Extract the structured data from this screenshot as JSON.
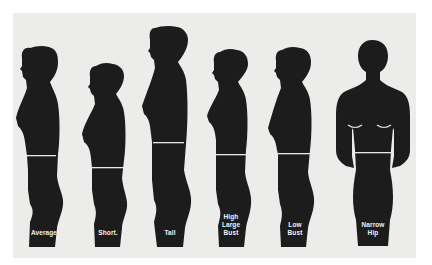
{
  "diagram": {
    "background": "#ececea",
    "figure_color": "#1c1c1c",
    "waistline_color": "#e8e8e8",
    "figures": [
      {
        "id": "average",
        "label": "Average",
        "view": "profile"
      },
      {
        "id": "short",
        "label": "Short.",
        "view": "profile"
      },
      {
        "id": "tall",
        "label": "Tall",
        "view": "profile"
      },
      {
        "id": "high-large-bust",
        "label": "High\nLarge\nBust",
        "view": "profile"
      },
      {
        "id": "low-bust",
        "label": "Low\nBust",
        "view": "profile"
      },
      {
        "id": "narrow-hip",
        "label": "Narrow\nHip",
        "view": "back"
      }
    ]
  }
}
